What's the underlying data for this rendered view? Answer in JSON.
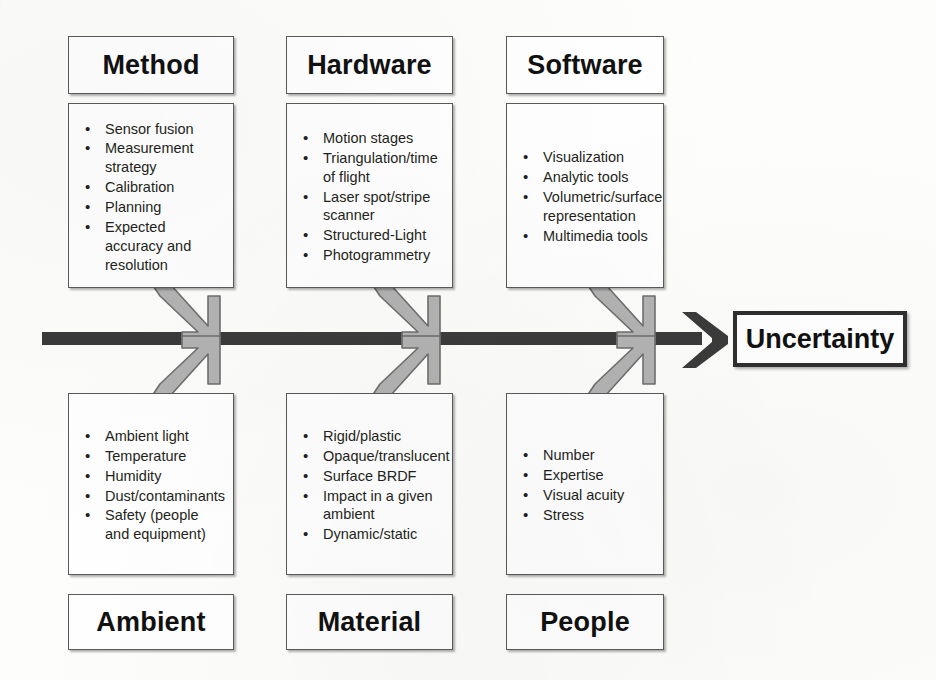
{
  "diagram": {
    "type": "fishbone-ishikawa",
    "effect": {
      "label": "Uncertainty"
    },
    "spine": {
      "color": "#3b3b3b",
      "arrow_color": "#3b3b3b"
    },
    "bone_arrow_color": "#b3b3b3",
    "bone_arrow_outline": "#6e6e6e",
    "box_border_color": "#5a5a5a",
    "text_color": "#231f20",
    "background_color": "#fdfdfc",
    "top_categories": [
      {
        "label": "Method",
        "items": [
          "Sensor fusion",
          "Measurement strategy",
          "Calibration",
          "Planning",
          "Expected accuracy and resolution"
        ]
      },
      {
        "label": "Hardware",
        "items": [
          "Motion stages",
          "Triangulation/time of flight",
          "Laser spot/stripe scanner",
          "Structured-Light",
          "Photogrammetry"
        ]
      },
      {
        "label": "Software",
        "items": [
          "Visualization",
          "Analytic tools",
          "Volumetric/surface representation",
          "Multimedia tools"
        ]
      }
    ],
    "bottom_categories": [
      {
        "label": "Ambient",
        "items": [
          "Ambient light",
          "Temperature",
          "Humidity",
          "Dust/contaminants",
          "Safety (people and equipment)"
        ]
      },
      {
        "label": "Material",
        "items": [
          "Rigid/plastic",
          "Opaque/translucent",
          "Surface BRDF",
          "Impact in a given ambient",
          "Dynamic/static"
        ]
      },
      {
        "label": "People",
        "items": [
          "Number",
          "Expertise",
          "Visual acuity",
          "Stress"
        ]
      }
    ]
  }
}
